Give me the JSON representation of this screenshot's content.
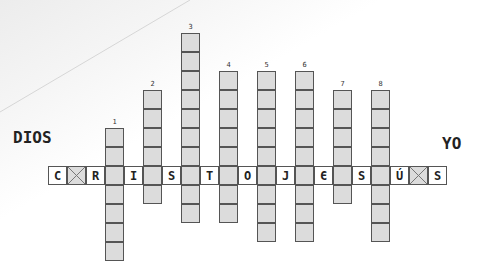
{
  "labels": {
    "left": "DIOS",
    "right": "YO"
  },
  "horizontal_word": {
    "cells": [
      {
        "type": "letter",
        "value": "C"
      },
      {
        "type": "cross",
        "value": "X"
      },
      {
        "type": "letter",
        "value": "R"
      },
      {
        "type": "column",
        "value": "1"
      },
      {
        "type": "letter",
        "value": "I"
      },
      {
        "type": "column",
        "value": "2"
      },
      {
        "type": "letter",
        "value": "S"
      },
      {
        "type": "column",
        "value": "3"
      },
      {
        "type": "letter",
        "value": "T"
      },
      {
        "type": "column",
        "value": "4"
      },
      {
        "type": "letter",
        "value": "O"
      },
      {
        "type": "column",
        "value": "5"
      },
      {
        "type": "letter",
        "value": "J"
      },
      {
        "type": "column",
        "value": "6"
      },
      {
        "type": "letter",
        "value": "Є"
      },
      {
        "type": "column",
        "value": "7"
      },
      {
        "type": "letter",
        "value": "S"
      },
      {
        "type": "column",
        "value": "8"
      },
      {
        "type": "letter",
        "value": "Ú"
      },
      {
        "type": "cross",
        "value": "X"
      },
      {
        "type": "letter",
        "value": "S"
      }
    ]
  },
  "columns": [
    {
      "number": "1",
      "cells_above": 2,
      "cells_below": 4
    },
    {
      "number": "2",
      "cells_above": 4,
      "cells_below": 1
    },
    {
      "number": "3",
      "cells_above": 7,
      "cells_below": 2
    },
    {
      "number": "4",
      "cells_above": 5,
      "cells_below": 2
    },
    {
      "number": "5",
      "cells_above": 5,
      "cells_below": 3
    },
    {
      "number": "6",
      "cells_above": 5,
      "cells_below": 3
    },
    {
      "number": "7",
      "cells_above": 4,
      "cells_below": 1
    },
    {
      "number": "8",
      "cells_above": 4,
      "cells_below": 3
    }
  ],
  "colors": {
    "shaded": "#dcdcdc",
    "border": "#555555",
    "text": "#222222"
  }
}
